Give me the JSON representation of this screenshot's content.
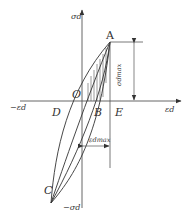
{
  "diagram": {
    "type": "stress-strain hysteresis loop",
    "axes": {
      "y_pos": "σd",
      "y_neg": "σd",
      "y_neg_sign": "−",
      "x_pos": "εd",
      "x_neg": "εd",
      "x_neg_sign": "−"
    },
    "points": {
      "A": "A",
      "B": "B",
      "C": "C",
      "D": "D",
      "E": "E",
      "O": "O"
    },
    "dimensions": {
      "stress_max": "σdmax",
      "strain_max": "εdmax"
    },
    "colors": {
      "line": "#333333",
      "background": "#ffffff"
    }
  }
}
